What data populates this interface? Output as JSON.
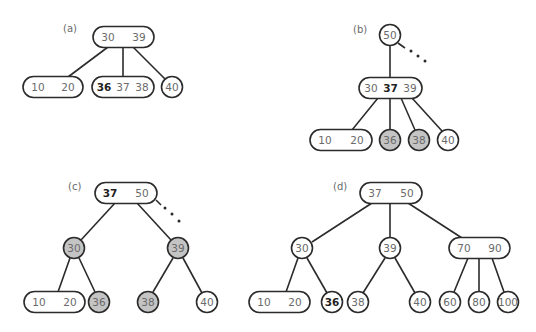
{
  "figure": {
    "panels": [
      {
        "label": "(a)",
        "nodes": [
          {
            "id": "a-root",
            "keys": [
              "30",
              "39"
            ],
            "bold": [],
            "shaded": false
          },
          {
            "id": "a-left",
            "keys": [
              "10",
              "20"
            ],
            "bold": [],
            "shaded": false
          },
          {
            "id": "a-mid",
            "keys": [
              "36",
              "37",
              "38"
            ],
            "bold": [
              "36"
            ],
            "shaded": false
          },
          {
            "id": "a-right",
            "keys": [
              "40"
            ],
            "bold": [],
            "shaded": false
          }
        ],
        "edges": [
          [
            "a-root",
            "a-left"
          ],
          [
            "a-root",
            "a-mid"
          ],
          [
            "a-root",
            "a-right"
          ]
        ]
      },
      {
        "label": "(b)",
        "nodes": [
          {
            "id": "b-top",
            "keys": [
              "50"
            ],
            "bold": [],
            "shaded": false
          },
          {
            "id": "b-mid",
            "keys": [
              "30",
              "37",
              "39"
            ],
            "bold": [
              "37"
            ],
            "shaded": false
          },
          {
            "id": "b-c1",
            "keys": [
              "10",
              "20"
            ],
            "bold": [],
            "shaded": false
          },
          {
            "id": "b-c2",
            "keys": [
              "36"
            ],
            "bold": [],
            "shaded": true
          },
          {
            "id": "b-c3",
            "keys": [
              "38"
            ],
            "bold": [],
            "shaded": true
          },
          {
            "id": "b-c4",
            "keys": [
              "40"
            ],
            "bold": [],
            "shaded": false
          }
        ],
        "edges": [
          [
            "b-top",
            "b-mid"
          ],
          [
            "b-mid",
            "b-c1"
          ],
          [
            "b-mid",
            "b-c2"
          ],
          [
            "b-mid",
            "b-c3"
          ],
          [
            "b-mid",
            "b-c4"
          ]
        ],
        "continuation": "..."
      },
      {
        "label": "(c)",
        "nodes": [
          {
            "id": "c-root",
            "keys": [
              "37",
              "50"
            ],
            "bold": [
              "37"
            ],
            "shaded": false
          },
          {
            "id": "c-l",
            "keys": [
              "30"
            ],
            "bold": [],
            "shaded": true
          },
          {
            "id": "c-r",
            "keys": [
              "39"
            ],
            "bold": [],
            "shaded": true
          },
          {
            "id": "c-ll",
            "keys": [
              "10",
              "20"
            ],
            "bold": [],
            "shaded": false
          },
          {
            "id": "c-lr",
            "keys": [
              "36"
            ],
            "bold": [],
            "shaded": true
          },
          {
            "id": "c-rl",
            "keys": [
              "38"
            ],
            "bold": [],
            "shaded": true
          },
          {
            "id": "c-rr",
            "keys": [
              "40"
            ],
            "bold": [],
            "shaded": false
          }
        ],
        "edges": [
          [
            "c-root",
            "c-l"
          ],
          [
            "c-root",
            "c-r"
          ],
          [
            "c-l",
            "c-ll"
          ],
          [
            "c-l",
            "c-lr"
          ],
          [
            "c-r",
            "c-rl"
          ],
          [
            "c-r",
            "c-rr"
          ]
        ],
        "continuation": "..."
      },
      {
        "label": "(d)",
        "nodes": [
          {
            "id": "d-root",
            "keys": [
              "37",
              "50"
            ],
            "bold": [],
            "shaded": false
          },
          {
            "id": "d-l",
            "keys": [
              "30"
            ],
            "bold": [],
            "shaded": false
          },
          {
            "id": "d-m",
            "keys": [
              "39"
            ],
            "bold": [],
            "shaded": false
          },
          {
            "id": "d-r",
            "keys": [
              "70",
              "90"
            ],
            "bold": [],
            "shaded": false
          },
          {
            "id": "d-ll",
            "keys": [
              "10",
              "20"
            ],
            "bold": [],
            "shaded": false
          },
          {
            "id": "d-lr",
            "keys": [
              "36"
            ],
            "bold": [
              "36"
            ],
            "shaded": false
          },
          {
            "id": "d-ml",
            "keys": [
              "38"
            ],
            "bold": [],
            "shaded": false
          },
          {
            "id": "d-mr",
            "keys": [
              "40"
            ],
            "bold": [],
            "shaded": false
          },
          {
            "id": "d-r1",
            "keys": [
              "60"
            ],
            "bold": [],
            "shaded": false
          },
          {
            "id": "d-r2",
            "keys": [
              "80"
            ],
            "bold": [],
            "shaded": false
          },
          {
            "id": "d-r3",
            "keys": [
              "100"
            ],
            "bold": [],
            "shaded": false
          }
        ],
        "edges": [
          [
            "d-root",
            "d-l"
          ],
          [
            "d-root",
            "d-m"
          ],
          [
            "d-root",
            "d-r"
          ],
          [
            "d-l",
            "d-ll"
          ],
          [
            "d-l",
            "d-lr"
          ],
          [
            "d-m",
            "d-ml"
          ],
          [
            "d-m",
            "d-mr"
          ],
          [
            "d-r",
            "d-r1"
          ],
          [
            "d-r",
            "d-r2"
          ],
          [
            "d-r",
            "d-r3"
          ]
        ]
      }
    ]
  }
}
